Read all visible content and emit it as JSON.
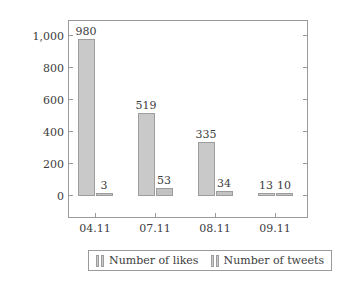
{
  "chart_data": {
    "type": "bar",
    "title": "",
    "subtitle": "",
    "xlabel": "",
    "ylabel": "Keyword: “Child alert”",
    "categories": [
      "04.11",
      "07.11",
      "08.11",
      "09.11"
    ],
    "series": [
      {
        "name": "Number of likes",
        "values": [
          980,
          519,
          335,
          13
        ]
      },
      {
        "name": "Number of tweets",
        "values": [
          3,
          53,
          34,
          10
        ]
      }
    ],
    "value_labels": {
      "Number of likes": [
        "980",
        "519",
        "335",
        "13"
      ],
      "Number of tweets": [
        "3",
        "53",
        "34",
        "10"
      ]
    },
    "ylim": [
      0,
      1080
    ],
    "yticks": [
      0,
      200,
      400,
      600,
      800,
      1000
    ],
    "ytick_labels": [
      "0",
      "200",
      "400",
      "600",
      "800",
      "1,000"
    ],
    "grid": false,
    "legend_position": "below",
    "colors": {
      "likes": "#c9c9c9",
      "tweets": "#c2c2c2",
      "bar_edge": "#9d9d9d",
      "axis": "#9a9a9a",
      "text": "#3d3d3d",
      "background": "#ffffff"
    }
  }
}
